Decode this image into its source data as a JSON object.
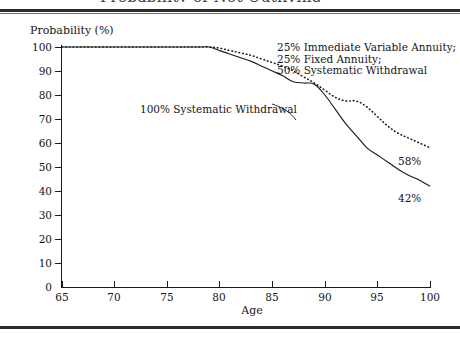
{
  "figure": {
    "title_cut": "Probability of Not Outliving Assets by Age",
    "ylabel": "Probability (%)",
    "xlabel": "Age"
  },
  "annotations": {
    "mix_line1": "25% Immediate Variable Annuity;",
    "mix_line2": "25% Fixed Annuity;",
    "mix_line3": "50% Systematic Withdrawal",
    "systematic": "100% Systematic Withdrawal",
    "endlabel_dotted": "58%",
    "endlabel_solid": "42%"
  },
  "chart_data": {
    "type": "line",
    "title": "",
    "xlabel": "Age",
    "ylabel": "Probability (%)",
    "xlim": [
      65,
      100
    ],
    "ylim": [
      0,
      100
    ],
    "xticks": [
      65,
      70,
      75,
      80,
      85,
      90,
      95,
      100
    ],
    "yticks": [
      0,
      10,
      20,
      30,
      40,
      50,
      60,
      70,
      80,
      90,
      100
    ],
    "grid": false,
    "legend_position": "inline-annotations",
    "x": [
      65,
      70,
      75,
      78,
      79,
      80,
      81,
      82,
      83,
      84,
      85,
      86,
      87,
      88,
      89,
      90,
      91,
      92,
      93,
      94,
      95,
      96,
      97,
      98,
      99,
      100
    ],
    "series": [
      {
        "name": "25% Immediate Variable Annuity; 25% Fixed Annuity; 50% Systematic Withdrawal",
        "style": "dotted",
        "end_label": "58%",
        "values": [
          100,
          100,
          100,
          100,
          100,
          99.5,
          98.5,
          97.5,
          96.5,
          95,
          93.5,
          92,
          90,
          87.5,
          85,
          82,
          79,
          77.5,
          77.5,
          75,
          71,
          67,
          64,
          62,
          60,
          58
        ]
      },
      {
        "name": "100% Systematic Withdrawal",
        "style": "solid",
        "end_label": "42%",
        "values": [
          100,
          100,
          100,
          100,
          100,
          98.5,
          97,
          95.5,
          94,
          92,
          90,
          88,
          85.5,
          85,
          84.5,
          80,
          74,
          68,
          63,
          58,
          55,
          52,
          49,
          46.5,
          44.5,
          42
        ]
      }
    ]
  }
}
